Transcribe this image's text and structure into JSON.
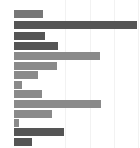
{
  "chart": {
    "title": "",
    "subtitle": "",
    "xlabel": "",
    "ylabel": "",
    "background_color": "#ffffff",
    "gridline_color": "#f2f2f2",
    "bar_start_x": 14,
    "bar_height": 8,
    "bar_spacing": 10,
    "first_bar_y": 10
  },
  "chart_data": {
    "type": "bar",
    "orientation": "horizontal",
    "title": "",
    "xlabel": "",
    "ylabel": "",
    "grid": true,
    "legend": "none",
    "xlim": [
      0,
      124
    ],
    "gridline_positions": [
      65,
      90,
      114,
      138
    ],
    "categories": [
      "1",
      "2",
      "3",
      "4",
      "5",
      "6",
      "7",
      "8",
      "9",
      "10",
      "11",
      "12",
      "13",
      "14"
    ],
    "values": [
      29,
      123,
      31,
      44,
      86,
      43,
      24,
      8,
      28,
      87,
      38,
      5,
      50,
      18
    ],
    "bar_end_pixels": [
      43,
      137,
      45,
      58,
      100,
      57,
      38,
      22,
      42,
      101,
      52,
      19,
      64,
      32
    ],
    "bar_colors": [
      "#777777",
      "#555555",
      "#555555",
      "#555555",
      "#8a8a8a",
      "#8a8a8a",
      "#8a8a8a",
      "#8a8a8a",
      "#8a8a8a",
      "#8a8a8a",
      "#8a8a8a",
      "#8a8a8a",
      "#555555",
      "#555555"
    ],
    "bar_y_pixels": [
      10,
      21,
      32,
      42,
      52,
      62,
      71,
      81,
      90,
      100,
      110,
      119,
      128,
      138
    ]
  }
}
